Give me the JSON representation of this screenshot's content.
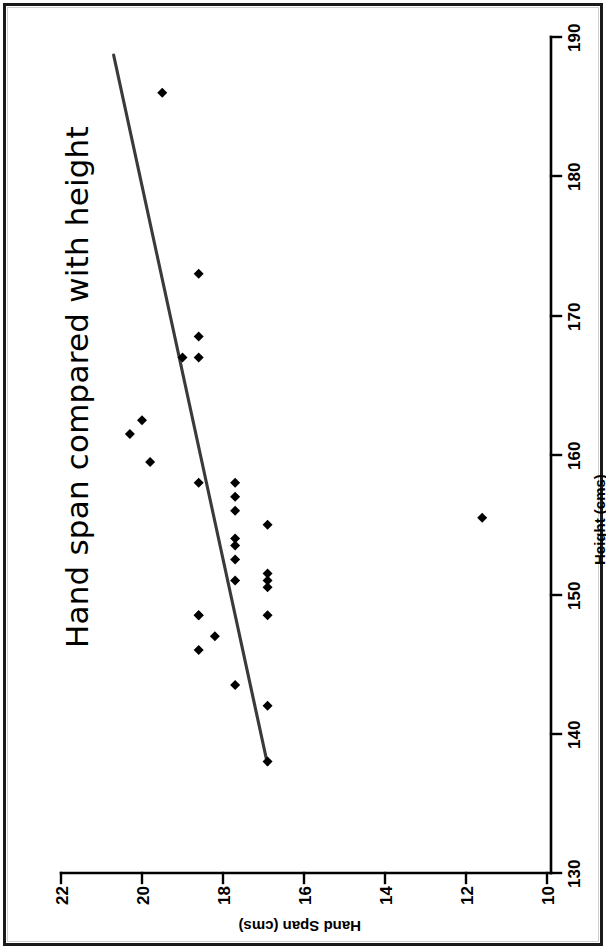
{
  "figure": {
    "title": "Hand span compared with height",
    "orientation": "rotated-90-ccw",
    "background_color": "#ffffff",
    "ink_color": "#000000",
    "trendline_color": "#3a3a3a"
  },
  "chart_data": {
    "type": "scatter",
    "title": "Hand span compared with height",
    "xlabel": "Height (cms)",
    "ylabel": "Hand Span (cms)",
    "xlim": [
      130,
      190
    ],
    "ylim": [
      10,
      22
    ],
    "xticks": [
      130,
      140,
      150,
      160,
      170,
      180,
      190
    ],
    "yticks": [
      10,
      12,
      14,
      16,
      18,
      20,
      22
    ],
    "xtick_labels": [
      "130",
      "140",
      "150",
      "160",
      "170",
      "180",
      "190"
    ],
    "ytick_labels": [
      "10",
      "12",
      "14",
      "16",
      "18",
      "20",
      "22"
    ],
    "grid": false,
    "legend": null,
    "series": [
      {
        "name": "Students",
        "marker": "diamond",
        "x": [
          186.0,
          173.0,
          168.5,
          167.0,
          167.0,
          161.5,
          162.5,
          159.5,
          158.0,
          158.0,
          157.0,
          156.0,
          154.0,
          155.0,
          153.5,
          152.5,
          151.0,
          151.0,
          148.5,
          148.5,
          147.0,
          146.0,
          151.5,
          150.5,
          148.5,
          143.5,
          142.0,
          138.0,
          155.5
        ],
        "y": [
          19.5,
          18.6,
          18.6,
          18.6,
          19.0,
          20.3,
          20.0,
          19.8,
          18.6,
          17.7,
          17.7,
          17.7,
          17.7,
          16.9,
          17.7,
          17.7,
          17.7,
          16.9,
          18.6,
          18.6,
          18.2,
          18.6,
          16.9,
          16.9,
          16.9,
          17.7,
          16.9,
          16.9,
          11.6
        ],
        "point_count": 29
      }
    ],
    "trendline": {
      "type": "linear-fit",
      "x_start": 188.7,
      "y_start": 20.7,
      "x_end": 137.8,
      "y_end": 16.9,
      "color": "#3a3a3a"
    }
  },
  "axes": {
    "x": {
      "title": "Height (cms)",
      "ticks": [
        "130",
        "140",
        "150",
        "160",
        "170",
        "180",
        "190"
      ]
    },
    "y": {
      "title": "Hand Span (cms)",
      "ticks": [
        "22",
        "20",
        "18",
        "16",
        "14",
        "12",
        "10"
      ]
    }
  }
}
